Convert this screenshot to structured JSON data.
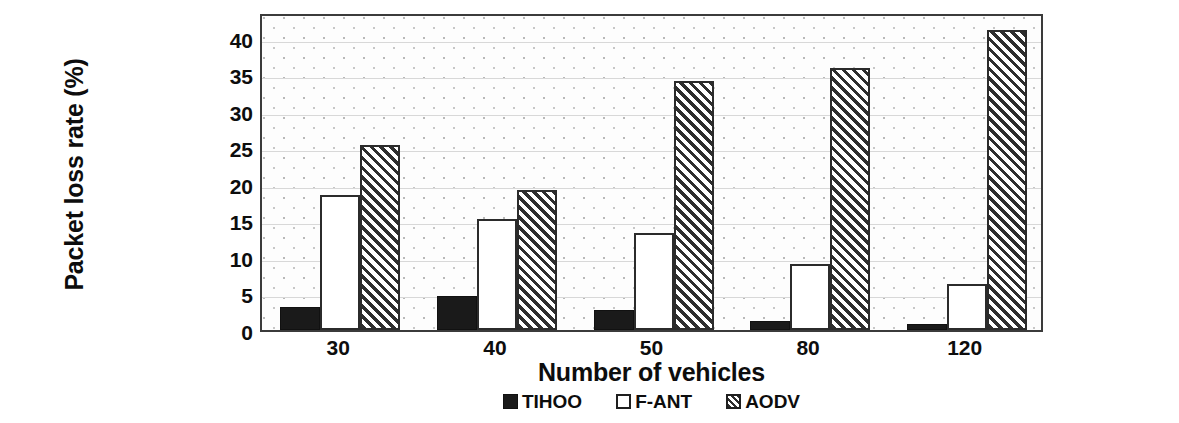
{
  "chart_data": {
    "type": "bar",
    "title": "",
    "xlabel": "Number of vehicles",
    "ylabel": "Packet loss rate (%)",
    "categories": [
      "30",
      "40",
      "50",
      "80",
      "120"
    ],
    "series": [
      {
        "name": "TIHOO",
        "style": "solid-black",
        "values": [
          3.2,
          4.6,
          2.8,
          1.3,
          0.8
        ]
      },
      {
        "name": "F-ANT",
        "style": "white-outline",
        "values": [
          18.5,
          15.2,
          13.3,
          9.0,
          6.3
        ]
      },
      {
        "name": "AODV",
        "style": "diagonal-hatch",
        "values": [
          25.3,
          19.2,
          34.0,
          35.8,
          41.0
        ]
      }
    ],
    "ylim": [
      0,
      43.5
    ],
    "yticks": [
      0,
      5,
      10,
      15,
      20,
      25,
      30,
      35,
      40
    ],
    "ytick_labels": [
      "0",
      "5",
      "10",
      "15",
      "20",
      "25",
      "30",
      "35",
      "40"
    ],
    "grid": true,
    "grid_axis": "y",
    "legend_position": "bottom-center",
    "plot_background": "dotted-stipple",
    "colors": {
      "tihoo": "#1a1a1a",
      "fant": "#ffffff",
      "aodv_hatch": "#2e2e2e",
      "border": "#3b3b3b",
      "gridline": "#d8d8d8",
      "text": "#0d0d0d",
      "plot_bg": "#fdfdfd"
    }
  }
}
